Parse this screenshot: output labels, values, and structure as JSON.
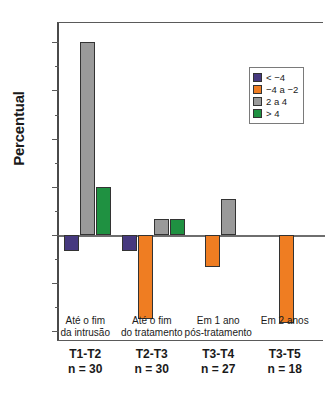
{
  "chart_data": {
    "type": "bar",
    "title": "",
    "xlabel": "",
    "ylabel": "Percentual",
    "ylim": [
      -22,
      44
    ],
    "grid": false,
    "legend_position": "top-right",
    "ytick_labels": [
      "40",
      "30",
      "20",
      "10",
      "0",
      "10",
      "20"
    ],
    "ytick_values": [
      40,
      30,
      20,
      10,
      0,
      -10,
      -20
    ],
    "yminor_values": [
      35,
      25,
      15,
      5,
      -5,
      -15
    ],
    "categories": [
      "T1-T2",
      "T2-T3",
      "T3-T4",
      "T3-T5"
    ],
    "category_descriptions": [
      {
        "line1": "Até o fim",
        "line2": "da intrusão"
      },
      {
        "line1": "Até o fim",
        "line2": "do tratamento"
      },
      {
        "line1": "Em 1 ano",
        "line2": "pós-tratamento"
      },
      {
        "line1": "Em 2 anos",
        "line2": ""
      }
    ],
    "sample_sizes": [
      "n = 30",
      "n = 30",
      "n = 27",
      "n = 18"
    ],
    "series": [
      {
        "name": "< −4",
        "color": "#46397f",
        "values": [
          -3.3,
          -3.3,
          0,
          0
        ]
      },
      {
        "name": "−4 a −2",
        "color": "#ef7d22",
        "values": [
          0,
          -17.5,
          -6.7,
          -18.3
        ]
      },
      {
        "name": "2 a 4",
        "color": "#9a9a9a",
        "values": [
          40.0,
          3.3,
          7.4,
          0
        ]
      },
      {
        "name": "> 4",
        "color": "#1f9141",
        "values": [
          10.0,
          3.3,
          0,
          0
        ]
      }
    ]
  },
  "legend": {
    "items": [
      {
        "label": "< −4",
        "color": "#46397f"
      },
      {
        "label": "−4 a −2",
        "color": "#ef7d22"
      },
      {
        "label": "2 a 4",
        "color": "#9a9a9a"
      },
      {
        "label": "> 4",
        "color": "#1f9141"
      }
    ]
  }
}
